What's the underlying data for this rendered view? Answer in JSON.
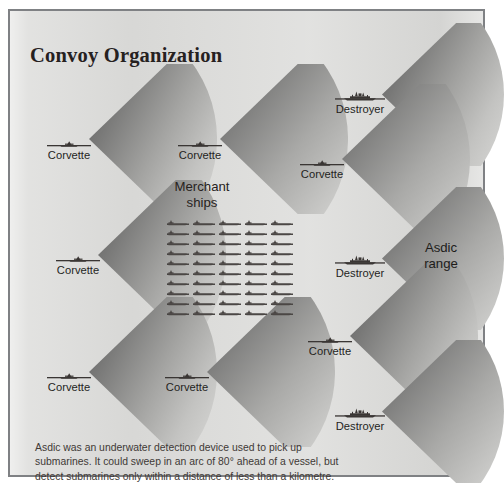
{
  "title": "Convoy Organization",
  "colors": {
    "background": "#dcdcda",
    "frame_border": "#7f8184",
    "title_text": "#26211f",
    "label_text": "#241f1d",
    "caption_text": "#403936",
    "cone_dark": "#6e6e6e",
    "cone_light": "#cfcfcd",
    "ship_icon": "#3a3634"
  },
  "merchant": {
    "label_line1": "Merchant",
    "label_line2": "ships",
    "rows": 10,
    "columns": 5,
    "total": 50,
    "icon_name": "merchant-ship-icon"
  },
  "asdic_range": {
    "label_line1": "Asdic",
    "label_line2": "range"
  },
  "escorts": [
    {
      "id": "corvette-top-left",
      "type": "Corvette",
      "icon": "corvette-icon",
      "x": 27,
      "y": 128,
      "cone_x": 79,
      "cone_y": 53,
      "cone_w": 128,
      "cone_h": 150
    },
    {
      "id": "corvette-top-center",
      "type": "Corvette",
      "icon": "corvette-icon",
      "x": 158,
      "y": 128,
      "cone_x": 210,
      "cone_y": 53,
      "cone_w": 128,
      "cone_h": 150
    },
    {
      "id": "destroyer-top-right",
      "type": "Destroyer",
      "icon": "destroyer-icon",
      "x": 318,
      "y": 79,
      "cone_x": 372,
      "cone_y": 12,
      "cone_w": 122,
      "cone_h": 143
    },
    {
      "id": "corvette-mid-right",
      "type": "Corvette",
      "icon": "corvette-icon",
      "x": 280,
      "y": 147,
      "cone_x": 332,
      "cone_y": 73,
      "cone_w": 128,
      "cone_h": 150
    },
    {
      "id": "corvette-mid-left",
      "type": "Corvette",
      "icon": "corvette-icon",
      "x": 36,
      "y": 243,
      "cone_x": 88,
      "cone_y": 169,
      "cone_w": 128,
      "cone_h": 150
    },
    {
      "id": "destroyer-mid-right",
      "type": "Destroyer",
      "icon": "destroyer-icon",
      "x": 318,
      "y": 243,
      "cone_x": 372,
      "cone_y": 176,
      "cone_w": 122,
      "cone_h": 143
    },
    {
      "id": "corvette-bottom-left",
      "type": "Corvette",
      "icon": "corvette-icon",
      "x": 27,
      "y": 360,
      "cone_x": 79,
      "cone_y": 286,
      "cone_w": 128,
      "cone_h": 150
    },
    {
      "id": "corvette-bottom-center",
      "type": "Corvette",
      "icon": "corvette-icon",
      "x": 145,
      "y": 360,
      "cone_x": 197,
      "cone_y": 286,
      "cone_w": 128,
      "cone_h": 150
    },
    {
      "id": "corvette-bottom-right",
      "type": "Corvette",
      "icon": "corvette-icon",
      "x": 288,
      "y": 324,
      "cone_x": 340,
      "cone_y": 250,
      "cone_w": 128,
      "cone_h": 150
    },
    {
      "id": "destroyer-bottom-right",
      "type": "Destroyer",
      "icon": "destroyer-icon",
      "x": 318,
      "y": 396,
      "cone_x": 372,
      "cone_y": 329,
      "cone_w": 122,
      "cone_h": 143
    }
  ],
  "caption": {
    "line1": "Asdic was an underwater detection device used to pick up",
    "line2": "submarines. It could sweep in an arc of 80° ahead of a vessel, but",
    "line3": "detect submarines only within a distance of less than a kilometre."
  }
}
